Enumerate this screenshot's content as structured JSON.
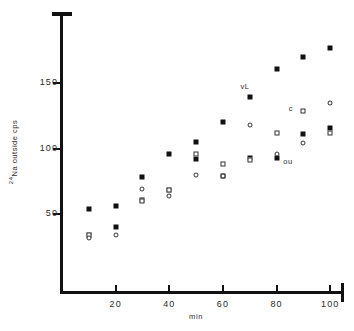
{
  "chart_data": {
    "type": "scatter",
    "title": "",
    "xlabel": "min",
    "ylabel": "24Na outside  cps",
    "ylabel_prefix_sup": "24",
    "ylabel_rest": "Na outside  cps",
    "xlim": [
      0,
      104
    ],
    "ylim": [
      0,
      200
    ],
    "grid": false,
    "legend": "none",
    "xticks": [
      20,
      40,
      60,
      80,
      100
    ],
    "xticklabels": [
      "20",
      "40",
      "60",
      "80",
      "100"
    ],
    "yticks": [
      50,
      100,
      150
    ],
    "yticklabels": [
      "50",
      "100",
      "150"
    ],
    "annotations": [
      {
        "text": "vL",
        "x": 68,
        "y": 147
      },
      {
        "text": "c",
        "x": 86,
        "y": 130
      },
      {
        "text": "ou",
        "x": 84,
        "y": 90
      }
    ],
    "series": [
      {
        "name": "vL",
        "marker": "filled-square",
        "x": [
          10,
          10,
          20,
          20,
          30,
          30,
          40,
          40,
          50,
          50,
          60,
          60,
          70,
          70,
          80,
          80,
          90,
          90,
          100,
          100
        ],
        "y": [
          54,
          34,
          56,
          40,
          78,
          61,
          96,
          68,
          105,
          92,
          120,
          79,
          139,
          93,
          161,
          93,
          170,
          111,
          177,
          116
        ]
      },
      {
        "name": "c",
        "marker": "open-square",
        "x": [
          10,
          30,
          40,
          50,
          60,
          70,
          80,
          90,
          100
        ],
        "y": [
          34,
          60,
          68,
          96,
          88,
          91,
          112,
          129,
          112
        ]
      },
      {
        "name": "ou",
        "marker": "open-circle",
        "x": [
          10,
          20,
          30,
          40,
          50,
          60,
          70,
          80,
          90,
          100
        ],
        "y": [
          32,
          34,
          69,
          64,
          80,
          79,
          118,
          96,
          104,
          135
        ]
      }
    ]
  }
}
